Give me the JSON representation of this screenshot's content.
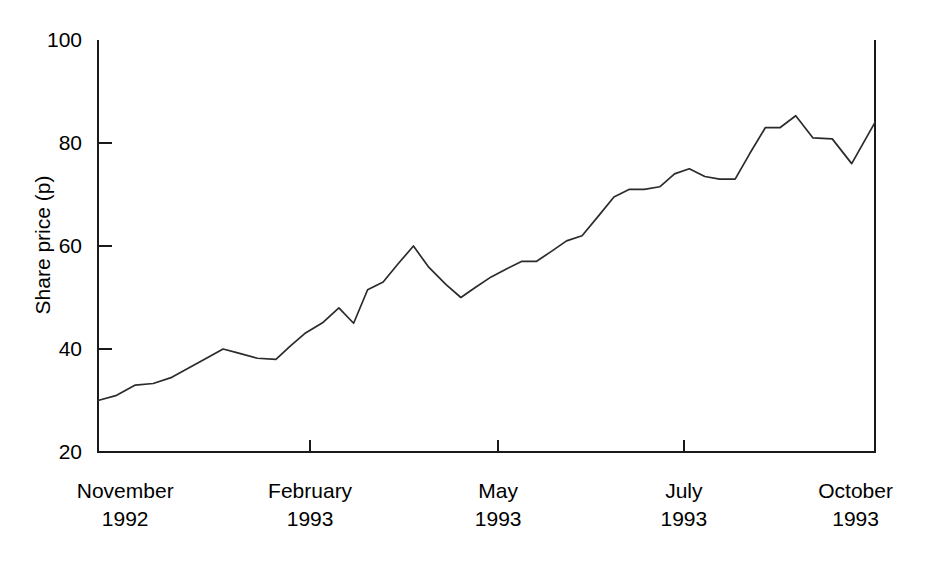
{
  "chart_data": {
    "type": "line",
    "title": "",
    "subtitle": "",
    "xlabel": "",
    "ylabel": "Share price (p)",
    "ylim": [
      20,
      100
    ],
    "yticks": [
      20,
      40,
      60,
      80,
      100
    ],
    "ytick_labels": [
      "20",
      "40",
      "60",
      "80",
      "100"
    ],
    "grid": false,
    "legend": "none",
    "x_axis_type": "time",
    "xtick_labels": [
      {
        "month": "November",
        "year": "1992"
      },
      {
        "month": "February",
        "year": "1993"
      },
      {
        "month": "May",
        "year": "1993"
      },
      {
        "month": "July",
        "year": "1993"
      },
      {
        "month": "October",
        "year": "1993"
      }
    ],
    "xtick_positions_frac": [
      0.035,
      0.273,
      0.515,
      0.754,
      0.975
    ],
    "line_color": "#2b2b2b",
    "axis_color": "#1a1a1a",
    "series": [
      {
        "name": "Share price",
        "x": [
          0.0,
          0.024,
          0.048,
          0.071,
          0.095,
          0.119,
          0.143,
          0.161,
          0.181,
          0.205,
          0.229,
          0.247,
          0.266,
          0.29,
          0.31,
          0.329,
          0.347,
          0.367,
          0.386,
          0.406,
          0.425,
          0.448,
          0.467,
          0.486,
          0.506,
          0.525,
          0.545,
          0.564,
          0.584,
          0.603,
          0.623,
          0.645,
          0.664,
          0.684,
          0.703,
          0.723,
          0.742,
          0.761,
          0.781,
          0.8,
          0.82,
          0.839,
          0.859,
          0.878,
          0.898,
          0.92,
          0.945,
          0.97,
          1.0
        ],
        "values": [
          30.0,
          31.0,
          33.0,
          33.3,
          34.5,
          36.5,
          38.5,
          40.0,
          39.2,
          38.2,
          38.0,
          40.5,
          43.0,
          45.2,
          48.0,
          45.0,
          51.5,
          53.0,
          56.5,
          60.0,
          56.0,
          52.5,
          50.0,
          52.0,
          54.0,
          55.5,
          57.0,
          57.0,
          59.0,
          61.0,
          62.0,
          66.0,
          69.5,
          71.0,
          71.0,
          71.5,
          74.0,
          75.0,
          73.5,
          73.0,
          73.0,
          78.0,
          83.0,
          83.0,
          85.3,
          81.0,
          80.8,
          76.0,
          84.0
        ]
      }
    ]
  },
  "axis": {
    "y_title": "Share price (p)"
  }
}
